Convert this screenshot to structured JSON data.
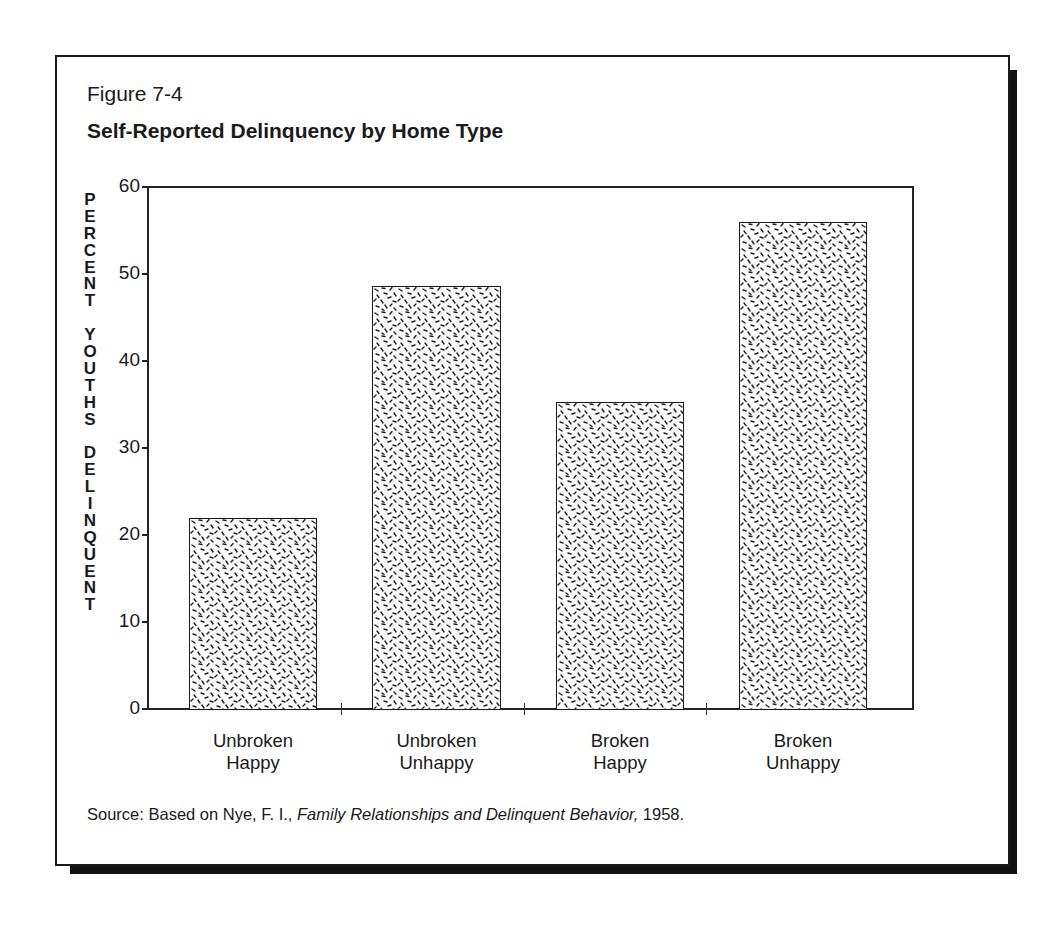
{
  "figure": {
    "label": "Figure 7-4",
    "title": "Self-Reported Delinquency by Home Type",
    "y_axis_label_letters": [
      "P",
      "E",
      "R",
      "C",
      "E",
      "N",
      "T",
      " ",
      "Y",
      "O",
      "U",
      "T",
      "H",
      "S",
      " ",
      "D",
      "E",
      "L",
      "I",
      "N",
      "Q",
      "U",
      "E",
      "N",
      "T"
    ],
    "y_axis_label": "PERCENT YOUTHS DELINQUENT",
    "source": {
      "prefix": "Source: Based on Nye, F. I., ",
      "title_italic": "Family Relationships and Delinquent Behavior,",
      "suffix": " 1958."
    }
  },
  "chart_data": {
    "type": "bar",
    "title": "Self-Reported Delinquency by Home Type",
    "xlabel": "",
    "ylabel": "PERCENT YOUTHS DELINQUENT",
    "categories": [
      "Unbroken Happy",
      "Unbroken Unhappy",
      "Broken Happy",
      "Broken Unhappy"
    ],
    "category_lines": [
      [
        "Unbroken",
        "Happy"
      ],
      [
        "Unbroken",
        "Unhappy"
      ],
      [
        "Broken",
        "Happy"
      ],
      [
        "Broken",
        "Unhappy"
      ]
    ],
    "values": [
      22,
      48.6,
      35.3,
      56
    ],
    "ylim": [
      0,
      60
    ],
    "yticks": [
      0,
      10,
      20,
      30,
      40,
      50,
      60
    ],
    "grid": false,
    "legend": null,
    "bar_fill": "stippled dash pattern",
    "source": "Source: Based on Nye, F. I., Family Relationships and Delinquent Behavior, 1958."
  },
  "colors": {
    "ink": "#1a1a1a",
    "background": "#ffffff",
    "shadow": "#111111"
  }
}
